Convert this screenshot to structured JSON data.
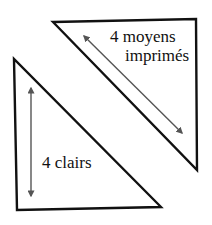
{
  "diagram": {
    "type": "two right triangles with double-headed arrows",
    "colors": {
      "background": "#ffffff",
      "outline": "#111111",
      "arrow": "#555555",
      "text": "#111111"
    },
    "triangles": [
      {
        "id": "upper-right-triangle",
        "points": [
          [
            53,
            22
          ],
          [
            196,
            19
          ],
          [
            197,
            170
          ]
        ],
        "label_lines": [
          "4 moyens",
          "imprimés"
        ],
        "arrow": {
          "from": [
            84,
            36
          ],
          "to": [
            182,
            133
          ],
          "double_headed": true
        }
      },
      {
        "id": "lower-left-triangle",
        "points": [
          [
            14,
            59
          ],
          [
            17,
            210
          ],
          [
            161,
            207
          ]
        ],
        "label_lines": [
          "4 clairs"
        ],
        "arrow": {
          "from": [
            31,
            88
          ],
          "to": [
            31,
            196
          ],
          "double_headed": true
        }
      }
    ]
  },
  "labels": {
    "upper_line1": "4 moyens",
    "upper_line2": "imprimés",
    "lower": "4 clairs"
  }
}
